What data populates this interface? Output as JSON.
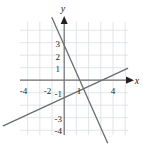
{
  "figure": {
    "name": "coordinate-plane-two-lines",
    "axis_labels": {
      "x": "x",
      "y": "y"
    },
    "x_tick_labels": [
      "-4",
      "-2",
      "1",
      "4"
    ],
    "y_tick_labels": [
      "3",
      "2",
      "1",
      "-1",
      "-3",
      "-4"
    ],
    "colors": {
      "grid": "#d9dde3",
      "axis": "#6f7276",
      "line": "#6a6d71",
      "text": "#231f20",
      "background": "#ffffff"
    }
  },
  "chart_data": {
    "type": "line",
    "title": "",
    "xlabel": "x",
    "ylabel": "y",
    "xlim": [
      -5,
      5.2
    ],
    "ylim": [
      -5,
      5
    ],
    "grid": true,
    "legend": false,
    "x_ticks": [
      -4,
      -2,
      1,
      4
    ],
    "y_ticks": [
      3,
      2,
      1,
      -1,
      -3,
      -4
    ],
    "x_tick_labels": [
      "-4",
      "-2",
      "1",
      "4"
    ],
    "y_tick_labels": [
      "3",
      "2",
      "1",
      "-1",
      "-3",
      "-4"
    ],
    "series": [
      {
        "name": "steep-descending-line",
        "slope": -2.2,
        "intercept": 2.8,
        "points": [
          [
            -1.0,
            5.0
          ],
          [
            3.55,
            -5.0
          ]
        ]
      },
      {
        "name": "shallow-ascending-line",
        "slope": 0.45,
        "intercept": -1.4,
        "points": [
          [
            -5.0,
            -3.65
          ],
          [
            5.2,
            0.94
          ]
        ]
      }
    ],
    "intersection": [
      1.58,
      -0.69
    ]
  }
}
